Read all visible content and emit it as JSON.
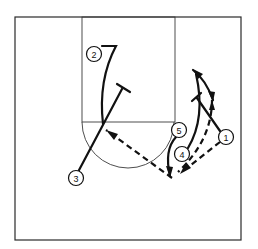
{
  "diagram": {
    "title": "",
    "type": "basketball-play",
    "colors": {
      "ink": "#111111",
      "background": "#ffffff"
    },
    "players": [
      {
        "id": "1",
        "label": "1",
        "x": 226,
        "y": 137
      },
      {
        "id": "2",
        "label": "2",
        "x": 94,
        "y": 54
      },
      {
        "id": "3",
        "label": "3",
        "x": 76,
        "y": 178
      },
      {
        "id": "4",
        "label": "4",
        "x": 182,
        "y": 154
      },
      {
        "id": "5",
        "label": "5",
        "x": 179,
        "y": 130
      }
    ],
    "legend": {
      "solid_line": "cut / player movement",
      "dashed_line": "pass",
      "t_line": "screen"
    }
  }
}
